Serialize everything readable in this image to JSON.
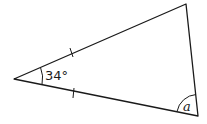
{
  "diagram": {
    "type": "isosceles-triangle",
    "vertices": {
      "apex": [
        14,
        79
      ],
      "top_right": [
        186,
        4
      ],
      "bottom_right": [
        198,
        116
      ]
    },
    "apex_angle_label": "34°",
    "unknown_angle_label": "a",
    "equal_side_marks": 2,
    "stroke_color": "#1a1a1a"
  }
}
